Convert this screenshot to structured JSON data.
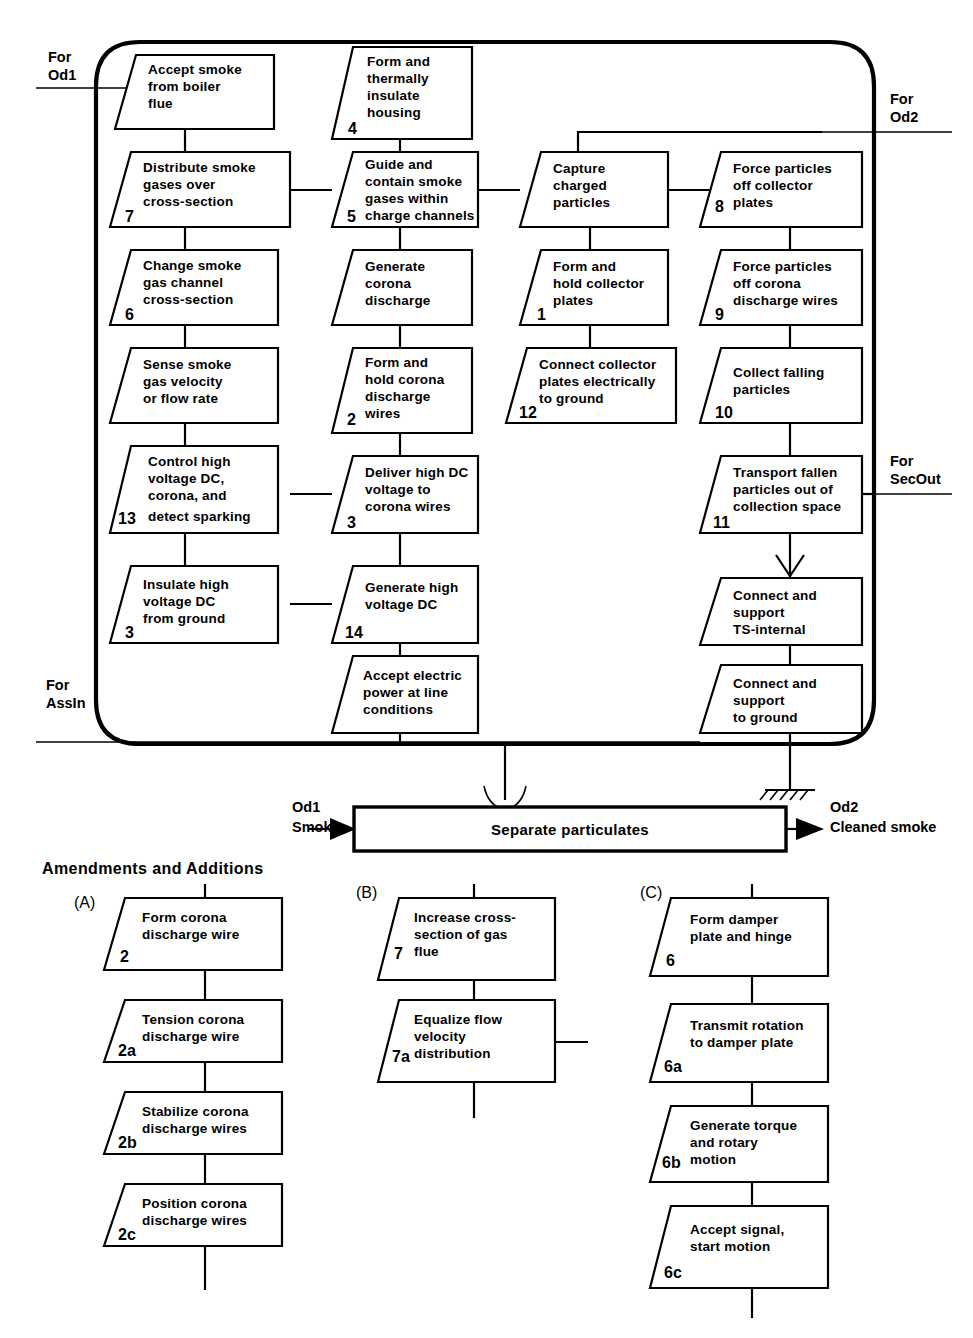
{
  "diagram": {
    "shell_label_top_left": "For\nOd1",
    "external_labels": [
      {
        "name": "for-od1",
        "line1": "For",
        "line2": "Od1"
      },
      {
        "name": "for-od2",
        "line1": "For",
        "line2": "Od2"
      },
      {
        "name": "for-secout",
        "line1": "For",
        "line2": "SecOut"
      },
      {
        "name": "for-assin",
        "line1": "For",
        "line2": "AssIn"
      }
    ],
    "boxes": [
      {
        "id": "b_accept_smoke",
        "num": "",
        "lines": [
          "Accept smoke",
          "from boiler",
          "flue"
        ]
      },
      {
        "id": "b_form_housing",
        "num": "4",
        "lines": [
          "Form and",
          "thermally",
          "insulate",
          "housing"
        ]
      },
      {
        "id": "b_distribute",
        "num": "7",
        "lines": [
          "Distribute smoke",
          "gases over",
          "cross-section"
        ]
      },
      {
        "id": "b_guide_contain",
        "num": "5",
        "lines": [
          "Guide and",
          "contain smoke",
          "gases within",
          "charge channels"
        ]
      },
      {
        "id": "b_capture",
        "num": "",
        "lines": [
          "Capture",
          "charged",
          "particles"
        ]
      },
      {
        "id": "b_force_coll",
        "num": "8",
        "lines": [
          "Force particles",
          "off collector",
          "plates"
        ]
      },
      {
        "id": "b_change_channel",
        "num": "6",
        "lines": [
          "Change smoke",
          "gas channel",
          "cross-section"
        ]
      },
      {
        "id": "b_gen_corona",
        "num": "",
        "lines": [
          "Generate",
          "corona",
          "discharge"
        ]
      },
      {
        "id": "b_form_plates",
        "num": "1",
        "lines": [
          "Form and",
          "hold collector",
          "plates"
        ]
      },
      {
        "id": "b_force_wires",
        "num": "9",
        "lines": [
          "Force particles",
          "off corona",
          "discharge wires"
        ]
      },
      {
        "id": "b_sense_velocity",
        "num": "",
        "lines": [
          "Sense smoke",
          "gas velocity",
          "or flow rate"
        ]
      },
      {
        "id": "b_hold_corona",
        "num": "2",
        "lines": [
          "Form and",
          "hold corona",
          "discharge",
          "wires"
        ]
      },
      {
        "id": "b_connect_ground",
        "num": "12",
        "lines": [
          "Connect collector",
          "plates electrically",
          "to ground"
        ]
      },
      {
        "id": "b_collect_fall",
        "num": "10",
        "lines": [
          "Collect falling",
          "particles"
        ]
      },
      {
        "id": "b_control_hv",
        "num": "13",
        "lines": [
          "Control high",
          "voltage DC,",
          "corona, and",
          "detect sparking"
        ]
      },
      {
        "id": "b_deliver_hv",
        "num": "3",
        "lines": [
          "Deliver high DC",
          "voltage to",
          "corona wires"
        ]
      },
      {
        "id": "b_transport",
        "num": "11",
        "lines": [
          "Transport fallen",
          "particles out of",
          "collection space"
        ]
      },
      {
        "id": "b_insulate_hv",
        "num": "3",
        "lines": [
          "Insulate high",
          "voltage DC",
          "from ground"
        ]
      },
      {
        "id": "b_gen_hv",
        "num": "14",
        "lines": [
          "Generate high",
          "voltage DC"
        ]
      },
      {
        "id": "b_conn_ts",
        "num": "",
        "lines": [
          "Connect and",
          "support",
          "TS-internal"
        ]
      },
      {
        "id": "b_accept_power",
        "num": "",
        "lines": [
          "Accept electric",
          "power at line",
          "conditions"
        ]
      },
      {
        "id": "b_conn_ground",
        "num": "",
        "lines": [
          "Connect and",
          "support",
          "to ground"
        ]
      }
    ],
    "separate": {
      "box_label": "Separate particulates",
      "input_tag": "Od1",
      "input_label": "Smoke",
      "output_tag": "Od2",
      "output_label": "Cleaned smoke"
    },
    "amendments": {
      "heading": "Amendments and Additions",
      "groups": [
        {
          "tag": "(A)",
          "boxes": [
            {
              "id": "a1",
              "num": "2",
              "lines": [
                "Form corona",
                "discharge wire"
              ]
            },
            {
              "id": "a2",
              "num": "2a",
              "lines": [
                "Tension corona",
                "discharge wire"
              ]
            },
            {
              "id": "a3",
              "num": "2b",
              "lines": [
                "Stabilize corona",
                "discharge wires"
              ]
            },
            {
              "id": "a4",
              "num": "2c",
              "lines": [
                "Position corona",
                "discharge wires"
              ]
            }
          ]
        },
        {
          "tag": "(B)",
          "boxes": [
            {
              "id": "b1",
              "num": "7",
              "lines": [
                "Increase cross-",
                "section of gas",
                "flue"
              ]
            },
            {
              "id": "b2",
              "num": "7a",
              "lines": [
                "Equalize flow",
                "velocity",
                "distribution"
              ]
            }
          ]
        },
        {
          "tag": "(C)",
          "boxes": [
            {
              "id": "c1",
              "num": "6",
              "lines": [
                "Form damper",
                "plate and hinge"
              ]
            },
            {
              "id": "c2",
              "num": "6a",
              "lines": [
                "Transmit rotation",
                "to damper plate"
              ]
            },
            {
              "id": "c3",
              "num": "6b",
              "lines": [
                "Generate torque",
                "and rotary",
                "motion"
              ]
            },
            {
              "id": "c4",
              "num": "6c",
              "lines": [
                "Accept signal,",
                "start motion"
              ]
            }
          ]
        }
      ]
    },
    "colors": {
      "ink": "#000000",
      "paper": "#ffffff"
    }
  }
}
